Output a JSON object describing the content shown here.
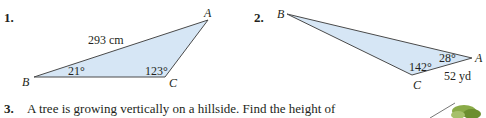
{
  "problems": [
    {
      "number": "1.",
      "triangle": {
        "vertices": {
          "A": "A",
          "B": "B",
          "C": "C"
        },
        "side_label": "293 cm",
        "angle_B": "21°",
        "angle_C": "123°"
      }
    },
    {
      "number": "2.",
      "triangle": {
        "vertices": {
          "A": "A",
          "B": "B",
          "C": "C"
        },
        "side_label": "52 yd",
        "angle_A": "28°",
        "angle_C": "142°"
      }
    },
    {
      "number": "3.",
      "text": "A tree is growing vertically on a hillside. Find the height of"
    }
  ],
  "colors": {
    "triangle_fill": "#d6e6f5",
    "triangle_stroke": "#4a4a4a",
    "text": "#231f20",
    "tree_green": "#7a9a3a"
  }
}
